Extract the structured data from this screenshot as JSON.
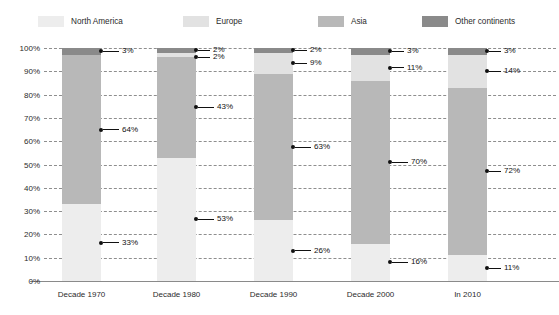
{
  "chart_data": {
    "type": "bar",
    "variant": "stacked-100-percent",
    "title": "",
    "subtitle": "",
    "xlabel": "",
    "ylabel": "",
    "categories": [
      "Decade 1970",
      "Decade 1980",
      "Decade 1990",
      "Decade 2000",
      "In 2010"
    ],
    "series": [
      {
        "name": "North America",
        "color": "#ededed",
        "values": [
          33,
          53,
          26,
          16,
          11
        ]
      },
      {
        "name": "Europe",
        "color": "#e2e2e2",
        "values": [
          0,
          2,
          9,
          11,
          14
        ]
      },
      {
        "name": "Asia",
        "color": "#b8b8b8",
        "values": [
          64,
          43,
          63,
          70,
          72
        ]
      },
      {
        "name": "Other continents",
        "color": "#8a8a8a",
        "values": [
          3,
          2,
          2,
          3,
          3
        ]
      }
    ],
    "stack_order_bottom_to_top": [
      "North America",
      "Asia",
      "Europe",
      "Other continents"
    ],
    "ylim": [
      0,
      100
    ],
    "yticks": [
      "0%",
      "10%",
      "20%",
      "30%",
      "40%",
      "50%",
      "60%",
      "70%",
      "80%",
      "90%",
      "100%"
    ],
    "ytick_values": [
      0,
      10,
      20,
      30,
      40,
      50,
      60,
      70,
      80,
      90,
      100
    ],
    "grid": true,
    "legend_position": "top",
    "data_labels": [
      {
        "category": "Decade 1970",
        "series": "Other continents",
        "text": "3%",
        "value": 3,
        "at_percent": 98.5
      },
      {
        "category": "Decade 1970",
        "series": "Asia",
        "text": "64%",
        "value": 64,
        "at_percent": 65.0
      },
      {
        "category": "Decade 1970",
        "series": "North America",
        "text": "33%",
        "value": 33,
        "at_percent": 16.5
      },
      {
        "category": "Decade 1980",
        "series": "Other continents",
        "text": "2%",
        "value": 2,
        "at_percent": 99.0
      },
      {
        "category": "Decade 1980",
        "series": "Europe",
        "text": "2%",
        "value": 2,
        "at_percent": 96.0
      },
      {
        "category": "Decade 1980",
        "series": "Asia",
        "text": "43%",
        "value": 43,
        "at_percent": 74.5
      },
      {
        "category": "Decade 1980",
        "series": "North America",
        "text": "53%",
        "value": 53,
        "at_percent": 26.5
      },
      {
        "category": "Decade 1990",
        "series": "Other continents",
        "text": "2%",
        "value": 2,
        "at_percent": 99.0
      },
      {
        "category": "Decade 1990",
        "series": "Europe",
        "text": "9%",
        "value": 9,
        "at_percent": 93.5
      },
      {
        "category": "Decade 1990",
        "series": "Asia",
        "text": "63%",
        "value": 63,
        "at_percent": 57.5
      },
      {
        "category": "Decade 1990",
        "series": "North America",
        "text": "26%",
        "value": 26,
        "at_percent": 13.0
      },
      {
        "category": "Decade 2000",
        "series": "Other continents",
        "text": "3%",
        "value": 3,
        "at_percent": 98.5
      },
      {
        "category": "Decade 2000",
        "series": "Europe",
        "text": "11%",
        "value": 11,
        "at_percent": 91.5
      },
      {
        "category": "Decade 2000",
        "series": "Asia",
        "text": "70%",
        "value": 70,
        "at_percent": 51.0
      },
      {
        "category": "Decade 2000",
        "series": "North America",
        "text": "16%",
        "value": 16,
        "at_percent": 8.0
      },
      {
        "category": "In 2010",
        "series": "Other continents",
        "text": "3%",
        "value": 3,
        "at_percent": 98.5
      },
      {
        "category": "In 2010",
        "series": "Europe",
        "text": "14%",
        "value": 14,
        "at_percent": 90.0
      },
      {
        "category": "In 2010",
        "series": "Asia",
        "text": "72%",
        "value": 72,
        "at_percent": 47.0
      },
      {
        "category": "In 2010",
        "series": "North America",
        "text": "11%",
        "value": 11,
        "at_percent": 5.5
      }
    ]
  },
  "legend": {
    "items": [
      {
        "label": "North America",
        "color": "#ededed",
        "x": 38
      },
      {
        "label": "Europe",
        "color": "#e2e2e2",
        "x": 183
      },
      {
        "label": "Asia",
        "color": "#b8b8b8",
        "x": 318
      },
      {
        "label": "Other continents",
        "color": "#8a8a8a",
        "x": 422
      }
    ]
  },
  "axis": {
    "grid_color": "#8e8e8e",
    "baseline_color": "#8a8a8a",
    "tick_text_color": "#2b2b2b"
  },
  "callout": {
    "dot_color": "#111111",
    "line_color": "#111111",
    "text_color": "#111111"
  }
}
